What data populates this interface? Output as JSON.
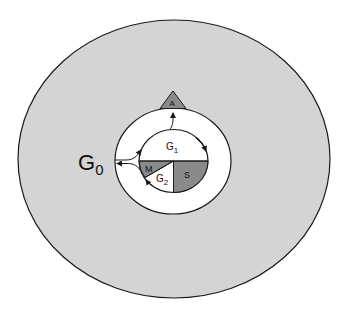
{
  "diagram": {
    "title": "",
    "colors": {
      "background": "#ffffff",
      "outer_region": "#d4d4d4",
      "ring": "#ffffff",
      "phase_dark": "#8a8a8a",
      "stroke": "#1a1a1a"
    },
    "labels": {
      "g0": "G",
      "g0_sub": "0",
      "g1": "G",
      "g1_sub": "1",
      "g2": "G",
      "g2_sub": "2",
      "s": "S",
      "m": "M",
      "a": "A"
    },
    "nodes": [
      {
        "id": "G0",
        "label": "G0",
        "kind": "outer quiescent region"
      },
      {
        "id": "G1",
        "label": "G1",
        "kind": "upper half of cycle"
      },
      {
        "id": "S",
        "label": "S",
        "kind": "lower-right quadrant, shaded"
      },
      {
        "id": "G2",
        "label": "G2",
        "kind": "lower-left wedge, white"
      },
      {
        "id": "M",
        "label": "M",
        "kind": "left wedge, shaded"
      },
      {
        "id": "A",
        "label": "A",
        "kind": "triangle on ring top, shaded"
      }
    ],
    "edges": [
      {
        "from": "G1",
        "to": "A",
        "style": "arrow"
      },
      {
        "from": "G1",
        "to": "S",
        "style": "arrow, clockwise along cycle"
      },
      {
        "from": "G2",
        "to": "M",
        "style": "arrow along cycle"
      },
      {
        "from": "M",
        "to": "G1",
        "style": "arrow along cycle"
      },
      {
        "from": "cycle",
        "to": "G0",
        "style": "arrow out through ring"
      },
      {
        "from": "G0",
        "to": "G1",
        "style": "arrow into cycle"
      }
    ]
  }
}
